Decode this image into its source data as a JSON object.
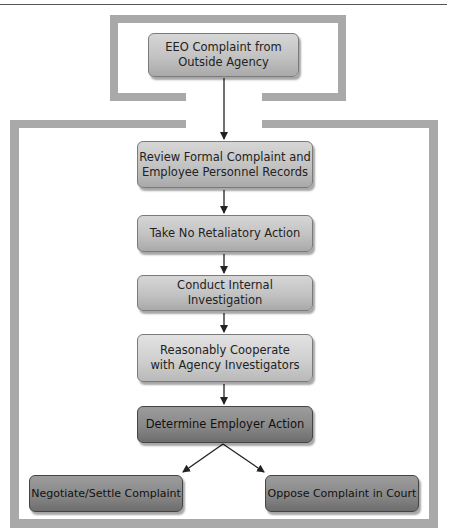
{
  "diagram": {
    "type": "flowchart",
    "nodes": [
      {
        "id": "eeo-complaint",
        "label_lines": [
          "EEO Complaint from",
          "Outside Agency"
        ]
      },
      {
        "id": "review-records",
        "label_lines": [
          "Review Formal Complaint and",
          "Employee Personnel Records"
        ]
      },
      {
        "id": "no-retaliation",
        "label_lines": [
          "Take No Retaliatory Action"
        ]
      },
      {
        "id": "internal-investigation",
        "label_lines": [
          "Conduct Internal Investigation"
        ]
      },
      {
        "id": "cooperate",
        "label_lines": [
          "Reasonably Cooperate",
          "with Agency Investigators"
        ]
      },
      {
        "id": "determine-action",
        "label_lines": [
          "Determine Employer Action"
        ]
      },
      {
        "id": "negotiate-settle",
        "label_lines": [
          "Negotiate/Settle Complaint"
        ]
      },
      {
        "id": "oppose-court",
        "label_lines": [
          "Oppose Complaint in Court"
        ]
      }
    ],
    "edges": [
      {
        "from": "eeo-complaint",
        "to": "review-records"
      },
      {
        "from": "review-records",
        "to": "no-retaliation"
      },
      {
        "from": "no-retaliation",
        "to": "internal-investigation"
      },
      {
        "from": "internal-investigation",
        "to": "cooperate"
      },
      {
        "from": "cooperate",
        "to": "determine-action"
      },
      {
        "from": "determine-action",
        "to": "negotiate-settle"
      },
      {
        "from": "determine-action",
        "to": "oppose-court"
      }
    ],
    "colors": {
      "frame": "#a9a9a9",
      "box_light": "#c8c8c8",
      "box_dark": "#858585",
      "arrow": "#222222"
    }
  }
}
